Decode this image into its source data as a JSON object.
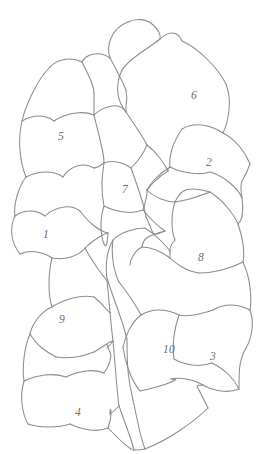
{
  "figure": {
    "kind": "hand-drawn line diagram",
    "background_color": "#ffffff",
    "stroke_color": "#8b8b8b",
    "label_color": "#6e6e6e",
    "label_style": "italic serif",
    "width": 262,
    "height": 454,
    "region_count": 10,
    "labels": [
      {
        "text": "1",
        "x": 46,
        "y": 235
      },
      {
        "text": "2",
        "x": 209,
        "y": 163
      },
      {
        "text": "3",
        "x": 213,
        "y": 357
      },
      {
        "text": "4",
        "x": 78,
        "y": 413
      },
      {
        "text": "5",
        "x": 61,
        "y": 137
      },
      {
        "text": "6",
        "x": 194,
        "y": 96
      },
      {
        "text": "7",
        "x": 125,
        "y": 190
      },
      {
        "text": "8",
        "x": 201,
        "y": 258
      },
      {
        "text": "9",
        "x": 62,
        "y": 320
      },
      {
        "text": "10",
        "x": 169,
        "y": 350
      }
    ],
    "strokes": [
      "M 128 22 C 136 18 146 19 152 24 C 158 29 161 34 160 39 C 163 36 168 33 172 33 C 177 33 180 36 182 41",
      "M 128 22 C 120 25 114 31 111 38 C 108 45 108 52 110 58",
      "M 110 58 C 106 55 100 53 94 54 C 88 55 84 58 82 62",
      "M 82 62 C 76 59 69 58 62 60 C 57 61 53 64 50 67",
      "M 160 39 C 154 44 146 49 139 54 C 132 59 126 64 122 70",
      "M 182 41 C 191 45 200 52 208 60 C 216 68 222 76 226 84",
      "M 122 70 C 118 78 117 86 118 94 C 119 101 122 107 126 112",
      "M 50 67 C 44 73 38 82 33 92 C 28 102 24 112 22 121",
      "M 22 121 C 27 118 33 116 39 116 C 45 116 50 118 54 121",
      "M 54 121 C 60 117 68 114 76 113 C 83 112 89 113 94 115",
      "M 94 115 C 99 110 106 107 112 106 C 118 105 123 107 126 112",
      "M 94 115 C 96 124 99 134 101 144 C 103 152 104 158 104 163",
      "M 22 121 C 20 130 19 141 20 151 C 21 161 23 170 26 177",
      "M 26 177 C 32 174 39 172 46 172 C 53 172 59 174 63 177",
      "M 63 177 C 66 172 71 168 77 166 C 83 164 89 165 94 168",
      "M 104 163 C 100 166 96 168 94 168",
      "M 26 177 C 22 182 19 189 17 196 C 15 203 14 210 15 216",
      "M 15 216 C 19 213 24 211 30 211 C 36 211 41 213 45 216",
      "M 45 216 C 50 211 57 208 64 207 C 70 206 76 208 80 211",
      "M 80 211 C 84 216 88 221 93 225 C 98 229 103 232 108 233",
      "M 15 216 C 12 222 11 229 12 236 C 13 243 16 249 20 254",
      "M 20 254 C 25 252 31 251 37 252 C 43 253 48 255 52 258",
      "M 52 258 C 58 259 65 259 71 257 C 77 255 82 252 85 248",
      "M 85 248 C 89 244 94 240 99 237 C 103 235 106 233 108 233",
      "M 226 84 C 229 92 230 101 229 110 C 228 119 226 127 223 133",
      "M 223 133 C 217 129 210 126 202 125 C 194 124 187 126 182 129",
      "M 182 129 C 178 135 174 142 172 149 C 170 156 169 162 170 167",
      "M 170 167 C 176 170 183 172 190 173 C 197 174 204 174 210 172",
      "M 210 172 C 217 174 224 178 230 183 C 236 188 240 193 242 198",
      "M 223 133 C 229 136 235 141 240 147 C 245 153 248 159 250 164",
      "M 250 164 C 248 170 245 176 242 181 C 240 185 241 192 242 198",
      "M 170 167 C 165 170 160 174 156 178 C 152 182 149 186 147 190",
      "M 147 190 C 151 194 156 197 161 199 C 166 201 171 202 175 202",
      "M 175 202 C 181 201 187 200 193 198 C 199 196 205 194 210 192",
      "M 210 192 C 216 196 222 201 227 207 C 232 213 236 219 238 224",
      "M 242 198 C 243 204 243 211 242 217 C 241 221 239 223 238 224",
      "M 175 202 C 173 208 172 215 172 222 C 172 229 173 235 175 240",
      "M 238 224 C 240 230 242 237 243 244 C 244 251 244 257 243 262",
      "M 243 262 C 237 265 230 268 222 270 C 214 272 206 273 199 273",
      "M 199 273 C 193 272 187 270 182 267 C 177 264 173 261 170 258",
      "M 170 258 C 166 255 161 252 156 250 C 151 248 146 247 142 247",
      "M 142 247 C 138 249 135 252 133 256 C 131 259 130 262 130 265",
      "M 175 240 C 172 243 170 247 170 251 C 170 254 170 256 170 258",
      "M 243 262 C 246 269 249 278 250 287 C 251 296 251 304 250 310",
      "M 250 310 C 244 307 238 305 231 305 C 224 305 218 307 213 310",
      "M 213 310 C 207 312 200 314 194 315 C 188 316 183 316 179 315",
      "M 179 315 C 177 321 175 328 174 336 C 173 344 173 352 174 359",
      "M 174 359 C 179 362 185 364 192 365 C 199 366 206 365 212 363",
      "M 212 363 C 218 366 224 370 229 375 C 234 380 237 385 239 389",
      "M 250 310 C 252 316 253 323 252 330 C 251 337 249 343 246 348",
      "M 246 348 C 243 353 241 359 240 365 C 239 371 239 380 239 389",
      "M 239 389 C 234 391 228 392 221 391 C 214 390 208 388 203 385",
      "M 203 385 C 198 382 192 380 186 379 C 180 378 175 378 171 379",
      "M 179 315 C 173 312 166 310 159 310 C 152 310 146 312 141 315",
      "M 141 315 C 136 319 132 324 129 330 C 126 336 124 342 123 347",
      "M 123 347 C 124 355 126 363 129 371 C 132 379 136 386 140 391",
      "M 140 391 C 146 390 153 388 160 386 C 167 384 172 382 175 380 C 176 380 177 379 171 379",
      "M 141 315 C 138 309 134 303 130 297 C 126 291 122 286 119 282",
      "M 119 282 C 116 276 114 269 113 261 C 112 253 112 246 113 240",
      "M 113 240 C 117 236 122 233 128 231 C 134 229 140 228 145 228",
      "M 145 228 C 150 231 155 235 160 240 C 164 244 168 248 170 251",
      "M 113 240 C 110 245 108 251 107 258 C 106 265 106 272 107 278",
      "M 107 278 C 110 288 114 299 118 310 C 122 321 125 331 127 339",
      "M 127 339 C 127 349 127 360 128 371 C 129 382 131 392 133 400",
      "M 133 400 C 135 409 137 419 139 428 C 141 437 143 444 145 449",
      "M 145 449 C 155 445 167 439 179 431 C 191 423 201 415 208 408",
      "M 208 408 C 205 402 202 396 199 390 C 197 387 195 385 203 385",
      "M 85 248 C 88 254 92 260 96 266 C 100 272 104 277 107 281",
      "M 107 281 C 108 290 109 301 110 312 C 111 323 112 333 113 341",
      "M 113 341 C 114 352 115 364 116 376 C 117 388 118 398 119 406",
      "M 119 406 C 122 414 125 423 128 431 C 131 439 133 446 134 450",
      "M 134 450 C 137 450 141 450 145 449",
      "M 119 406 C 116 409 113 412 110 414",
      "M 113 341 C 111 344 109 346 107 348",
      "M 52 258 C 50 266 49 275 49 284 C 49 293 50 301 52 307",
      "M 52 307 C 47 309 42 313 38 318 C 34 323 31 329 30 334",
      "M 30 334 C 33 339 37 344 42 348 C 47 352 52 355 56 357",
      "M 56 357 C 62 358 69 358 76 357 C 83 356 89 354 94 352",
      "M 94 352 C 99 349 103 346 107 344 C 108 343 108 342 113 341",
      "M 52 307 C 58 303 65 300 73 298 C 81 296 88 296 94 297",
      "M 94 297 C 99 301 104 306 108 311 C 110 313 111 313 110 312",
      "M 30 334 C 27 341 25 349 24 358 C 23 367 23 375 24 381",
      "M 24 381 C 30 378 37 376 45 375 C 53 374 60 375 66 377",
      "M 66 377 C 72 374 79 372 86 371 C 93 370 99 371 104 373",
      "M 104 373 C 107 369 109 365 110 361 C 111 357 111 354 110 352",
      "M 110 352 C 108 348 107 346 107 344",
      "M 24 381 C 22 388 21 396 22 404 C 23 412 25 419 28 424",
      "M 28 424 C 34 426 41 427 49 427 C 57 427 64 426 70 424",
      "M 70 424 C 76 427 83 429 90 430 C 97 431 103 430 108 428",
      "M 108 428 C 110 423 111 418 111 413 C 111 409 110 407 110 414",
      "M 108 428 C 112 432 116 436 120 440 C 124 444 128 447 131 449",
      "M 131 449 C 132 450 133 450 134 450",
      "M 126 112 C 130 118 134 124 138 130 C 142 136 145 141 147 145",
      "M 147 145 C 145 150 142 155 139 159 C 136 163 133 166 131 168",
      "M 131 168 C 127 165 122 163 117 162 C 112 161 107 162 104 163",
      "M 147 145 C 151 148 155 152 159 157 C 163 162 166 167 168 171",
      "M 168 171 C 167 169 169 168 170 167",
      "M 104 163 C 103 170 102 178 102 186 C 102 194 103 201 104 206",
      "M 104 206 C 110 209 117 211 124 212 C 131 213 138 212 143 210",
      "M 143 210 C 145 205 146 199 147 194 C 147 191 147 190 147 190",
      "M 143 210 C 146 214 150 218 154 222 C 158 226 162 229 165 231",
      "M 104 206 C 102 212 101 219 101 226 C 101 233 102 239 104 244",
      "M 104 244 C 106 247 107 248 108 233",
      "M 165 231 C 160 232 155 234 150 236 C 146 238 143 240 142 247",
      "M 131 168 C 134 176 137 185 140 194 C 143 203 145 211 146 217",
      "M 110 58 C 114 65 118 73 122 81 C 124 85 125 88 126 90",
      "M 82 62 C 85 68 88 74 91 81 C 93 86 94 90 94 93",
      "M 126 90 C 127 95 127 101 126 106 C 126 109 126 111 126 112",
      "M 94 93 C 94 99 94 106 94 112 C 94 114 94 115 94 115",
      "M 168 171 C 163 174 158 178 154 182 C 151 185 149 188 147 190",
      "M 210 192 C 204 190 198 189 192 189 C 186 189 181 190 175 202",
      "M 146 217 C 148 221 150 226 152 231 C 153 234 154 236 165 231"
    ]
  }
}
